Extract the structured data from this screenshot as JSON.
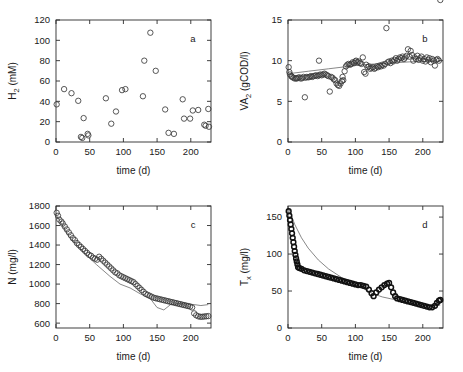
{
  "figure": {
    "width": 463,
    "height": 372,
    "background": "#ffffff",
    "marker_color": "#3a3a3a",
    "line_color": "#555555"
  },
  "chart_data": [
    {
      "type": "scatter",
      "panel_label": "a",
      "title": "",
      "xlabel": "time (d)",
      "ylabel": "H_2 (mM)",
      "ylabel_text": "H2 (mM)",
      "xlim": [
        0,
        230
      ],
      "ylim": [
        0,
        120
      ],
      "xticks": [
        0,
        50,
        100,
        150,
        200
      ],
      "yticks": [
        0,
        20,
        40,
        60,
        80,
        100,
        120
      ],
      "grid": false,
      "legend": "none",
      "has_fit_line": false,
      "x": [
        1,
        12,
        23,
        33,
        37,
        39,
        41,
        47,
        48,
        74,
        82,
        89,
        98,
        103,
        129,
        131,
        140,
        148,
        162,
        167,
        175,
        188,
        190,
        199,
        203,
        211,
        220,
        222,
        226,
        227
      ],
      "y": [
        37,
        52,
        48,
        40.5,
        5,
        4,
        23.5,
        8,
        6.5,
        43,
        18,
        30,
        51,
        52,
        45,
        80,
        107.5,
        70,
        32,
        9,
        8,
        42,
        23,
        23,
        31,
        31.5,
        17,
        16,
        32.5,
        15
      ]
    },
    {
      "type": "scatter",
      "panel_label": "b",
      "title": "",
      "xlabel": "time (d)",
      "ylabel": "VA_2 (gCOD/l)",
      "ylabel_text": "VA2 (gCOD/l)",
      "xlim": [
        0,
        230
      ],
      "ylim": [
        0,
        15
      ],
      "xticks": [
        0,
        50,
        100,
        150,
        200
      ],
      "yticks": [
        0,
        5,
        10,
        15
      ],
      "grid": false,
      "legend": "none",
      "has_fit_line": true,
      "x": [
        1,
        2,
        3,
        5,
        6,
        8,
        10,
        12,
        13,
        15,
        17,
        19,
        21,
        23,
        25,
        26,
        28,
        30,
        32,
        34,
        36,
        38,
        40,
        42,
        44,
        46,
        46,
        48,
        50,
        52,
        54,
        56,
        58,
        60,
        62,
        64,
        66,
        68,
        70,
        72,
        74,
        76,
        78,
        80,
        81,
        82,
        84,
        86,
        88,
        90,
        92,
        94,
        96,
        98,
        100,
        101,
        103,
        105,
        107,
        109,
        111,
        113,
        115,
        116,
        118,
        120,
        122,
        124,
        126,
        128,
        130,
        132,
        134,
        136,
        138,
        140,
        142,
        144,
        146,
        148,
        150,
        152,
        154,
        156,
        158,
        160,
        162,
        164,
        166,
        168,
        170,
        172,
        174,
        176,
        178,
        180,
        182,
        184,
        186,
        188,
        190,
        192,
        194,
        196,
        198,
        200,
        202,
        204,
        206,
        208,
        210,
        212,
        214,
        216,
        218,
        220,
        222,
        224,
        226
      ],
      "y": [
        9.2,
        8.6,
        8.3,
        8.1,
        8.0,
        7.9,
        7.8,
        7.85,
        7.8,
        7.9,
        7.95,
        7.8,
        7.85,
        8.0,
        5.5,
        7.9,
        8.0,
        7.95,
        8.0,
        8.1,
        8.0,
        8.1,
        8.15,
        8.2,
        8.1,
        10.0,
        8.2,
        8.3,
        8.2,
        8.3,
        8.4,
        8.3,
        8.2,
        8.1,
        6.2,
        8.0,
        7.9,
        7.7,
        7.6,
        7.2,
        7.0,
        6.9,
        7.2,
        7.5,
        8.0,
        7.6,
        8.7,
        9.3,
        9.5,
        9.6,
        9.5,
        9.6,
        9.8,
        9.7,
        9.9,
        10.0,
        9.8,
        9.9,
        9.7,
        9.6,
        10.4,
        8.6,
        8.4,
        9.5,
        9.2,
        9.3,
        9.0,
        9.1,
        9.2,
        9.0,
        9.1,
        9.3,
        9.2,
        9.4,
        9.3,
        9.5,
        9.4,
        9.6,
        14.0,
        9.8,
        9.9,
        9.7,
        10.0,
        9.9,
        10.1,
        10.3,
        10.0,
        10.2,
        10.4,
        10.3,
        10.5,
        10.2,
        10.4,
        10.6,
        11.4,
        10.5,
        11.2,
        10.7,
        10.0,
        10.4,
        10.2,
        10.6,
        10.1,
        10.3,
        10.5,
        10.0,
        10.2,
        9.9,
        10.4,
        10.1,
        10.3,
        9.8,
        10.2,
        10.0,
        9.4,
        10.1,
        10.2,
        10.0
      ],
      "fit_x": [
        1,
        30,
        60,
        90,
        100,
        120,
        150,
        180,
        200,
        226
      ],
      "fit_y": [
        8.4,
        8.7,
        9.0,
        9.3,
        9.4,
        9.55,
        9.7,
        9.85,
        9.9,
        9.95
      ]
    },
    {
      "type": "scatter",
      "panel_label": "c",
      "title": "",
      "xlabel": "time (d)",
      "ylabel": "N (mg/l)",
      "ylabel_text": "N (mg/l)",
      "xlim": [
        0,
        230
      ],
      "ylim": [
        550,
        1800
      ],
      "xticks": [
        0,
        50,
        100,
        150,
        200
      ],
      "yticks": [
        600,
        800,
        1000,
        1200,
        1400,
        1600,
        1800
      ],
      "grid": false,
      "legend": "none",
      "has_fit_line": true,
      "x": [
        1,
        3,
        5,
        8,
        10,
        13,
        16,
        19,
        22,
        25,
        28,
        31,
        34,
        37,
        40,
        43,
        46,
        49,
        52,
        55,
        58,
        61,
        64,
        67,
        70,
        73,
        76,
        79,
        82,
        85,
        88,
        91,
        94,
        97,
        100,
        103,
        106,
        109,
        112,
        115,
        118,
        121,
        124,
        127,
        130,
        133,
        136,
        139,
        142,
        145,
        148,
        151,
        154,
        157,
        160,
        163,
        166,
        169,
        172,
        175,
        178,
        181,
        184,
        187,
        190,
        193,
        196,
        199,
        202,
        205,
        208,
        211,
        214,
        217,
        220,
        223,
        226
      ],
      "y": [
        1730,
        1700,
        1660,
        1640,
        1620,
        1590,
        1560,
        1530,
        1500,
        1470,
        1450,
        1420,
        1400,
        1380,
        1360,
        1340,
        1320,
        1300,
        1290,
        1270,
        1260,
        1250,
        1280,
        1260,
        1240,
        1220,
        1200,
        1180,
        1160,
        1140,
        1120,
        1110,
        1090,
        1080,
        1070,
        1060,
        1050,
        1040,
        1030,
        1020,
        1000,
        980,
        960,
        940,
        920,
        900,
        890,
        880,
        870,
        860,
        855,
        850,
        845,
        840,
        835,
        830,
        825,
        820,
        815,
        810,
        805,
        800,
        795,
        790,
        785,
        780,
        775,
        770,
        760,
        700,
        680,
        670,
        665,
        665,
        668,
        670,
        672
      ],
      "fit_x": [
        1,
        20,
        40,
        60,
        80,
        95,
        110,
        125,
        140,
        150,
        160,
        170,
        185,
        195,
        205,
        215,
        226
      ],
      "fit_y": [
        1700,
        1480,
        1330,
        1200,
        1080,
        1000,
        960,
        900,
        850,
        760,
        735,
        790,
        800,
        795,
        790,
        780,
        790
      ]
    },
    {
      "type": "scatter",
      "panel_label": "d",
      "title": "",
      "xlabel": "time (d)",
      "ylabel": "T_x (mg/l)",
      "ylabel_text": "Tx (mg/l)",
      "xlim": [
        0,
        230
      ],
      "ylim": [
        0,
        165
      ],
      "xticks": [
        0,
        50,
        100,
        150,
        200
      ],
      "yticks": [
        0,
        50,
        100,
        150
      ],
      "grid": false,
      "legend": "none",
      "has_fit_line": true,
      "x": [
        1,
        2,
        3,
        4,
        5,
        6,
        7,
        8,
        9,
        10,
        11,
        12,
        13,
        14,
        15,
        17,
        20,
        24,
        28,
        32,
        36,
        40,
        44,
        48,
        52,
        56,
        60,
        64,
        68,
        72,
        76,
        80,
        84,
        88,
        92,
        96,
        100,
        104,
        108,
        112,
        116,
        120,
        124,
        127,
        131,
        135,
        139,
        143,
        147,
        150,
        153,
        156,
        159,
        162,
        166,
        170,
        174,
        178,
        182,
        186,
        190,
        194,
        198,
        202,
        206,
        210,
        214,
        218,
        221,
        224,
        226
      ],
      "y": [
        158,
        152,
        146,
        140,
        134,
        128,
        122,
        116,
        110,
        104,
        99,
        94,
        90,
        86,
        82,
        81,
        80,
        78,
        77,
        76,
        75,
        74,
        73,
        72,
        71,
        70,
        69,
        68,
        67,
        66,
        65,
        64,
        63,
        62,
        61,
        60,
        59,
        58,
        58,
        57,
        56,
        52,
        47,
        43,
        48,
        52,
        55,
        58,
        60,
        61,
        55,
        48,
        43,
        40,
        39,
        38,
        37,
        36,
        35,
        34,
        33,
        32,
        31,
        30,
        29,
        28,
        28,
        30,
        34,
        37,
        38
      ],
      "fit_x": [
        1,
        10,
        20,
        30,
        45,
        60,
        80,
        100,
        115,
        127,
        140,
        160,
        180,
        200,
        215,
        226
      ],
      "fit_y": [
        162,
        140,
        122,
        108,
        92,
        80,
        68,
        58,
        52,
        46,
        42,
        38,
        34,
        31,
        30,
        31
      ]
    }
  ]
}
